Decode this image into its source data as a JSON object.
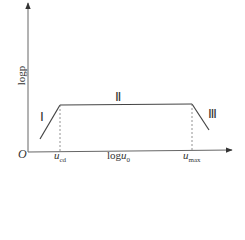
{
  "diagram": {
    "type": "piecewise log-log curve",
    "axes": {
      "origin_label": "O",
      "y_label": "logp",
      "x_label_text": "log",
      "x_label_var": "u",
      "x_label_sub": "0"
    },
    "ticks": [
      {
        "id": "u_cd",
        "var": "u",
        "sub": "cd"
      },
      {
        "id": "u_max",
        "var": "u",
        "sub": "max"
      }
    ],
    "regions": [
      {
        "id": "I",
        "label": "Ⅰ",
        "shape": "rising line"
      },
      {
        "id": "II",
        "label": "Ⅱ",
        "shape": "flat line"
      },
      {
        "id": "III",
        "label": "Ⅲ",
        "shape": "falling line"
      }
    ],
    "colors": {
      "axis": "#555555",
      "curve": "#444444",
      "dashed": "#777777",
      "text": "#333333"
    }
  }
}
